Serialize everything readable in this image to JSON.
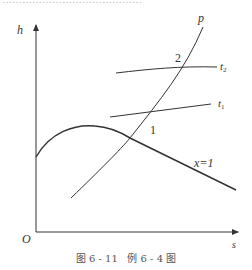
{
  "top_cut_text": "……………………………………",
  "axes": {
    "y_label": "h",
    "x_label": "s",
    "origin_label": "O"
  },
  "curves": {
    "saturation_label": "x=1",
    "pressure_label": "p",
    "isotherm_upper_label": "t",
    "isotherm_upper_sub": "2",
    "isotherm_lower_label": "t",
    "isotherm_lower_sub": "1"
  },
  "points": {
    "state1": "1",
    "state2": "2"
  },
  "caption": "图 6 - 11   例 6 - 4 图",
  "colors": {
    "line": "#333333",
    "text": "#333333",
    "caption": "#555555"
  }
}
